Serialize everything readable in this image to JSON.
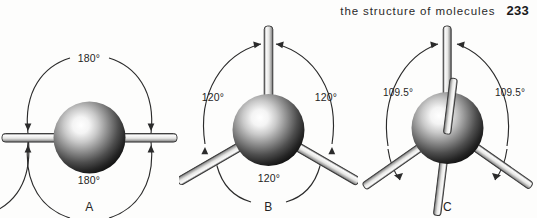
{
  "running_head": {
    "text": "the structure of molecules",
    "page_number": "233"
  },
  "figure": {
    "caption_letters": [
      "A",
      "B",
      "C"
    ],
    "panels": [
      {
        "letter": "A",
        "geometry_name": "linear",
        "bond_count": 2,
        "angles": [
          "180°",
          "180°"
        ],
        "angle_top": "180°",
        "angle_bottom": "180°"
      },
      {
        "letter": "B",
        "geometry_name": "trigonal planar",
        "bond_count": 3,
        "angles": [
          "120°",
          "120°",
          "120°"
        ],
        "angle_left": "120°",
        "angle_right": "120°",
        "angle_bottom": "120°"
      },
      {
        "letter": "C",
        "geometry_name": "tetrahedral",
        "bond_count": 4,
        "angles": [
          "109.5°",
          "109.5°"
        ],
        "angle_left": "109.5°",
        "angle_right": "109.5°"
      }
    ]
  },
  "colors": {
    "page_background": "#fdfdfc",
    "text": "#1f1f1f",
    "arc_stroke": "#2b2b2b",
    "rod_fill": "#f2f2f0",
    "rod_outline": "#3a3a3a",
    "sphere_highlight": "#ffffff",
    "sphere_mid": "#6e6e6e",
    "sphere_edge": "#101010"
  }
}
